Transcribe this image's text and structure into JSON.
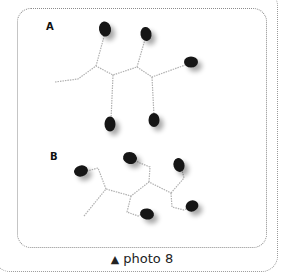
{
  "figure": {
    "panels": [
      {
        "label": "A"
      },
      {
        "label": "B"
      }
    ],
    "caption": {
      "marker": "▲",
      "text": "photo 8"
    }
  },
  "colors": {
    "frame_dotted": "#8c8c8c",
    "bead": "#1a1a1a",
    "wire": "#b8b8b8"
  }
}
